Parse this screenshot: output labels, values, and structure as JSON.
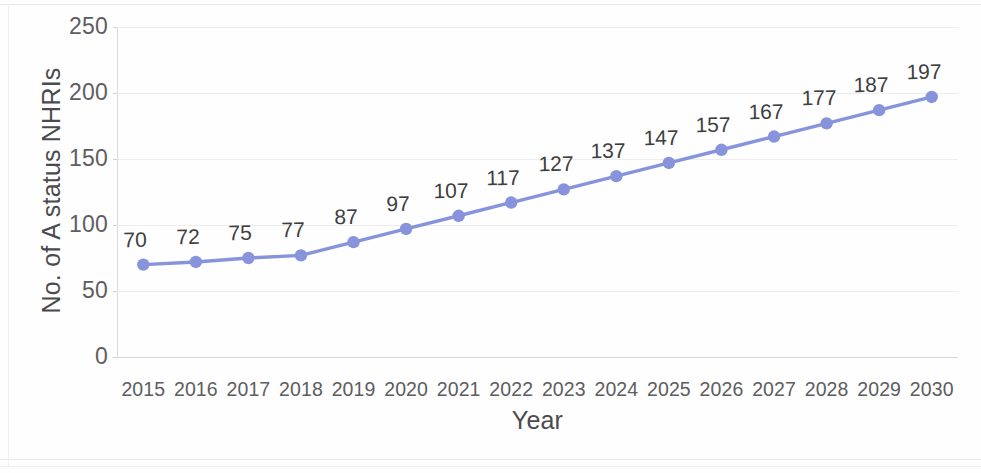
{
  "chart_data": {
    "type": "line",
    "title": "",
    "xlabel": "Year",
    "ylabel": "No. of A status NHRIs",
    "categories": [
      "2015",
      "2016",
      "2017",
      "2018",
      "2019",
      "2020",
      "2021",
      "2022",
      "2023",
      "2024",
      "2025",
      "2026",
      "2027",
      "2028",
      "2029",
      "2030"
    ],
    "values": [
      70,
      72,
      75,
      77,
      87,
      97,
      107,
      117,
      127,
      137,
      147,
      157,
      167,
      177,
      187,
      197
    ],
    "data_labels": [
      "70",
      "72",
      "75",
      "77",
      "87",
      "97",
      "107",
      "117",
      "127",
      "137",
      "147",
      "157",
      "167",
      "177",
      "187",
      "197"
    ],
    "ylim": [
      0,
      250
    ],
    "yticks": [
      0,
      50,
      100,
      150,
      200,
      250
    ],
    "ytick_labels": [
      "0",
      "50",
      "100",
      "150",
      "200",
      "250"
    ],
    "grid": true,
    "legend": "none",
    "series_color": "#8793db",
    "marker_color": "#8793db",
    "marker_shape": "circle",
    "label_color": "#3f3f41",
    "axis_text_color": "#5d5d5f",
    "gridline_color": "#ededee",
    "background": "#ffffff"
  }
}
